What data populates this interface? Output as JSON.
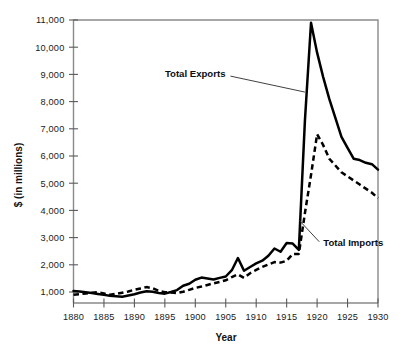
{
  "chart_data": {
    "type": "line",
    "title": "",
    "subtitle": "",
    "xlabel": "Year",
    "ylabel": "$ (in millions)",
    "xlim": [
      1880,
      1930
    ],
    "ylim": [
      0,
      11000
    ],
    "grid": false,
    "legend_position": "inline-annotation",
    "xticks": [
      1880,
      1885,
      1890,
      1895,
      1900,
      1905,
      1910,
      1915,
      1920,
      1925,
      1930
    ],
    "xticklabels": [
      "1880",
      "1885",
      "1890",
      "1895",
      "1900",
      "1905",
      "1910",
      "1915",
      "1920",
      "1925",
      "1930"
    ],
    "yticks": [
      1000,
      2000,
      3000,
      4000,
      5000,
      6000,
      7000,
      8000,
      9000,
      10000,
      11000
    ],
    "yticklabels": [
      "1,000",
      "2,000",
      "3,000",
      "4,000",
      "5,000",
      "6,000",
      "7,000",
      "8,000",
      "9,000",
      "10,000",
      "11,000"
    ],
    "x": [
      1880,
      1881,
      1882,
      1883,
      1884,
      1885,
      1886,
      1887,
      1888,
      1889,
      1890,
      1891,
      1892,
      1893,
      1894,
      1895,
      1896,
      1897,
      1898,
      1899,
      1900,
      1901,
      1902,
      1903,
      1904,
      1905,
      1906,
      1907,
      1908,
      1909,
      1910,
      1911,
      1912,
      1913,
      1914,
      1915,
      1916,
      1917,
      1918,
      1919,
      1920,
      1921,
      1922,
      1923,
      1924,
      1925,
      1926,
      1927,
      1928,
      1929,
      1930
    ],
    "series": [
      {
        "name": "Total Exports",
        "style": "solid",
        "color": "#000000",
        "values": [
          1040,
          1020,
          990,
          960,
          930,
          895,
          860,
          840,
          825,
          870,
          920,
          980,
          1030,
          1010,
          960,
          940,
          1000,
          1070,
          1230,
          1305,
          1450,
          1530,
          1500,
          1460,
          1520,
          1570,
          1800,
          2250,
          1780,
          1920,
          2050,
          2150,
          2330,
          2600,
          2480,
          2800,
          2780,
          2550,
          7300,
          10900,
          9800,
          8900,
          8100,
          7400,
          6700,
          6300,
          5900,
          5850,
          5750,
          5700,
          5500
        ]
      },
      {
        "name": "Total Imports",
        "style": "dashed",
        "color": "#000000",
        "values": [
          900,
          920,
          945,
          970,
          990,
          945,
          900,
          930,
          975,
          1020,
          1080,
          1130,
          1180,
          1140,
          1040,
          990,
          980,
          960,
          1010,
          1080,
          1150,
          1200,
          1260,
          1320,
          1370,
          1430,
          1550,
          1650,
          1520,
          1690,
          1810,
          1920,
          2010,
          2100,
          2080,
          2150,
          2400,
          2400,
          3900,
          5300,
          6800,
          6400,
          5900,
          5650,
          5400,
          5250,
          5100,
          4950,
          4800,
          4650,
          4450
        ]
      }
    ],
    "annotations": [
      {
        "text": "Total Exports",
        "target_x": 1918,
        "target_y": 8350,
        "label_x": 1902,
        "label_y": 8900
      },
      {
        "text": "Total Imports",
        "target_x": 1917,
        "target_y": 3650,
        "label_x": 1922,
        "label_y": 2700
      }
    ]
  },
  "axes": {
    "y_title": "$ (in millions)",
    "x_title": "Year"
  },
  "colors": {
    "background": "#ffffff",
    "frame": "#8a8a8a",
    "line": "#000000",
    "text": "#1a1a1a"
  }
}
